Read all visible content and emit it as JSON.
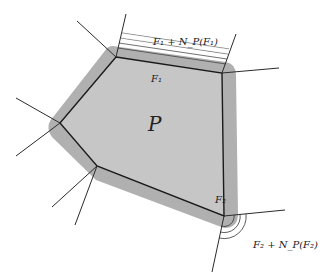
{
  "diagram": {
    "title_label": "P",
    "face1_label": "F₁",
    "face2_label": "F₂",
    "annot1": "F₁ + N_P(F₁)",
    "annot2": "F₂ + N_P(F₂)",
    "colors": {
      "fill": "#c9c9c9",
      "band": "#a8a8a8",
      "edge": "#1a1a1a",
      "ray": "#333333"
    },
    "vertices": [
      [
        116,
        57
      ],
      [
        222,
        73
      ],
      [
        224,
        216
      ],
      [
        97,
        166
      ],
      [
        60,
        123
      ]
    ]
  }
}
